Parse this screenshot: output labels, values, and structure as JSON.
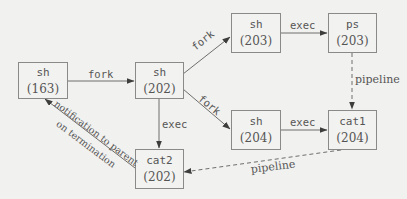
{
  "diagram": {
    "type": "process-flow",
    "nodes": [
      {
        "id": "sh163",
        "command": "sh",
        "pid": "(163)"
      },
      {
        "id": "sh202",
        "command": "sh",
        "pid": "(202)"
      },
      {
        "id": "sh203",
        "command": "sh",
        "pid": "(203)"
      },
      {
        "id": "ps203",
        "command": "ps",
        "pid": "(203)"
      },
      {
        "id": "sh204",
        "command": "sh",
        "pid": "(204)"
      },
      {
        "id": "cat1_204",
        "command": "cat1",
        "pid": "(204)"
      },
      {
        "id": "cat2_202",
        "command": "cat2",
        "pid": "(202)"
      }
    ],
    "edges": [
      {
        "from": "sh163",
        "to": "sh202",
        "label": "fork",
        "style": "solid"
      },
      {
        "from": "sh202",
        "to": "sh203",
        "label": "fork",
        "style": "solid"
      },
      {
        "from": "sh202",
        "to": "sh204",
        "label": "fork",
        "style": "solid"
      },
      {
        "from": "sh203",
        "to": "ps203",
        "label": "exec",
        "style": "solid"
      },
      {
        "from": "sh204",
        "to": "cat1_204",
        "label": "exec",
        "style": "solid"
      },
      {
        "from": "sh202",
        "to": "cat2_202",
        "label": "exec",
        "style": "solid"
      },
      {
        "from": "ps203",
        "to": "cat1_204",
        "label": "pipeline",
        "style": "dashed"
      },
      {
        "from": "cat1_204",
        "to": "cat2_202",
        "label": "pipeline",
        "style": "dashed"
      },
      {
        "from": "cat2_202",
        "to": "sh163",
        "label": "notification to parent on termination",
        "label_lines": [
          "notification to parent",
          "on termination"
        ],
        "style": "solid"
      }
    ]
  },
  "colors": {
    "background": "#f1f1ef",
    "line": "#6e6e6c",
    "text": "#555555"
  }
}
